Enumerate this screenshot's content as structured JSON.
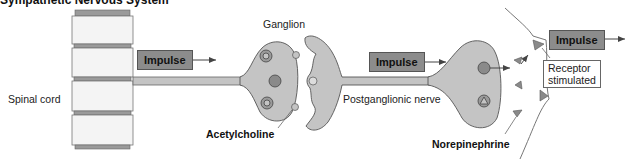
{
  "title": "Sympathetic Nervous System",
  "labels": {
    "spinal_cord": "Spinal cord",
    "ganglion": "Ganglion",
    "acetylcholine": "Acetylcholine",
    "postganglionic_nerve": "Postganglionic nerve",
    "norepinephrine": "Norepinephrine",
    "receptor_line1": "Receptor",
    "receptor_line2": "stimulated"
  },
  "impulse_boxes": [
    {
      "label": "Impulse"
    },
    {
      "label": "Impulse"
    },
    {
      "label": "Impulse"
    }
  ],
  "colors": {
    "impulse_fill": "#8c8c8c",
    "cell_fill": "#c4c4c4",
    "cell_stroke": "#555555",
    "vesicle_fill": "#8a8a8a",
    "disc_fill": "#9a9a9a",
    "vertebra_fill": "#f4f4f4"
  }
}
